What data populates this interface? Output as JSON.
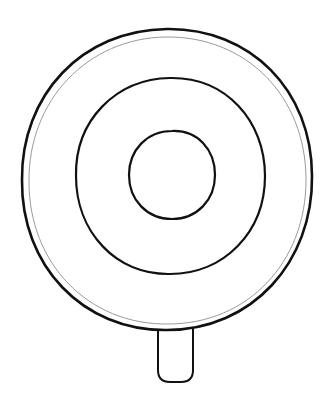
{
  "illustration": {
    "subject": "lollipop line art",
    "colors": {
      "background": "#ffffff",
      "stroke": "#111111",
      "inner_rim_stroke": "#9a9a9a"
    },
    "shapes": {
      "outer_circle": {
        "cx": 167,
        "cy": 179,
        "rx": 145,
        "ry": 150
      },
      "outer_rim": {
        "cx": 167,
        "cy": 181,
        "rx": 139,
        "ry": 144
      },
      "middle_ring": {
        "cx": 170,
        "cy": 176,
        "rx": 95,
        "ry": 98
      },
      "inner_circle": {
        "cx": 172,
        "cy": 175,
        "rx": 43,
        "ry": 44
      },
      "stick": {
        "x": 158,
        "y": 328,
        "width": 35,
        "height": 54
      }
    }
  }
}
